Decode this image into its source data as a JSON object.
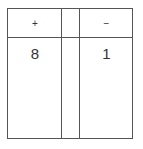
{
  "table": {
    "columns": [
      {
        "header": "+",
        "value": "8"
      },
      {
        "header": "",
        "value": ""
      },
      {
        "header": "−",
        "value": "1"
      }
    ]
  }
}
